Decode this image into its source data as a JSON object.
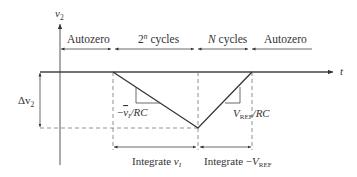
{
  "diagram": {
    "y_axis_label": "v",
    "y_axis_sub": "2",
    "x_axis_label": "t",
    "phases": [
      {
        "label": "Autozero"
      },
      {
        "label_base": "2",
        "label_sup": "n",
        "label_rest": " cycles"
      },
      {
        "label_var": "N",
        "label_rest": " cycles"
      },
      {
        "label": "Autozero"
      }
    ],
    "delta_label": "Δv",
    "delta_sub": "2",
    "slope_down": {
      "prefix": "−",
      "var": "v",
      "sub": "I",
      "suffix": "/RC"
    },
    "slope_up": {
      "var": "V",
      "sub": "REF",
      "suffix": "/RC"
    },
    "integrate_1": {
      "text": "Integrate ",
      "var": "v",
      "sub": "I"
    },
    "integrate_2": {
      "text": "Integrate −",
      "var": "V",
      "sub": "REF"
    },
    "colors": {
      "line": "#333333",
      "dash": "#777777"
    }
  }
}
